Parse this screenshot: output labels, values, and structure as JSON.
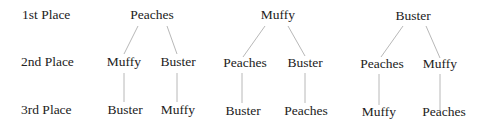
{
  "row_labels": [
    "1st Place",
    "2nd Place",
    "3rd Place"
  ],
  "trees": [
    {
      "first": "Peaches",
      "second": [
        "Muffy",
        "Buster"
      ],
      "third": [
        "Buster",
        "Muffy"
      ]
    },
    {
      "first": "Muffy",
      "second": [
        "Peaches",
        "Buster"
      ],
      "third": [
        "Buster",
        "Peaches"
      ]
    },
    {
      "first": "Buster",
      "second": [
        "Peaches",
        "Muffy"
      ],
      "third": [
        "Muffy",
        "Peaches"
      ]
    }
  ]
}
